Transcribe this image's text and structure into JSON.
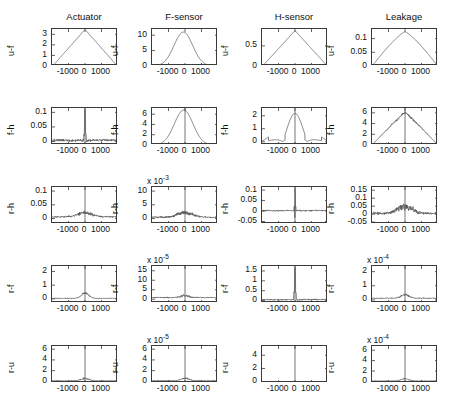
{
  "figure": {
    "grid_rows": 5,
    "grid_cols": 4,
    "line_color": "#555555",
    "axis_color": "#3a3a3a"
  },
  "column_titles": [
    {
      "label": "Actuator"
    },
    {
      "label": "F-sensor"
    },
    {
      "label": "H-sensor"
    },
    {
      "label": "Leakage"
    }
  ],
  "row_labels": [
    {
      "label": "u-f"
    },
    {
      "label": "f-h"
    },
    {
      "label": "r-h"
    },
    {
      "label": "r-f"
    },
    {
      "label": "r-u"
    }
  ],
  "xaxis": {
    "ticks": [
      "-1000",
      "0",
      "1000"
    ],
    "tick_values": [
      -1000,
      0,
      1000
    ],
    "range": [
      -2000,
      2000
    ]
  },
  "chart_data": {
    "type": "line",
    "title": "",
    "subtitle": "",
    "xlabel": "lag",
    "ylabel": "correlation",
    "grid": false,
    "legend": "none",
    "layout": {
      "rows": 5,
      "cols": 4
    },
    "shared_x": {
      "ticks": [
        -1000,
        0,
        1000
      ],
      "range": [
        -2000,
        2000
      ]
    },
    "panels": [
      {
        "row": 1,
        "col": 1,
        "row_label": "u-f",
        "col_title": "Actuator",
        "yticks": [
          "0",
          "1",
          "2",
          "3"
        ],
        "ytick_values": [
          0,
          1,
          2,
          3
        ],
        "ylim": [
          0,
          3.5
        ],
        "multiplier": "",
        "shape": "triangle",
        "peak_x": 0,
        "peak_y": 3.45,
        "baseline": 0,
        "noise": 0.0
      },
      {
        "row": 1,
        "col": 2,
        "row_label": "u-f",
        "col_title": "F-sensor",
        "yticks": [
          "0",
          "5",
          "10"
        ],
        "ytick_values": [
          0,
          5,
          10
        ],
        "ylim": [
          0,
          12
        ],
        "multiplier": "",
        "shape": "bell",
        "peak_x": -100,
        "peak_y": 11,
        "baseline": 0,
        "noise": 0.0
      },
      {
        "row": 1,
        "col": 3,
        "row_label": "u-f",
        "col_title": "H-sensor",
        "yticks": [
          "0",
          "0.5"
        ],
        "ytick_values": [
          0,
          0.5
        ],
        "ylim": [
          0,
          0.92
        ],
        "multiplier": "",
        "shape": "triangle",
        "peak_x": 0,
        "peak_y": 0.88,
        "baseline": 0,
        "noise": 0.0
      },
      {
        "row": 1,
        "col": 4,
        "row_label": "u-f",
        "col_title": "Leakage",
        "yticks": [
          "0",
          "0.05",
          "0.1"
        ],
        "ytick_values": [
          0,
          0.05,
          0.1
        ],
        "ylim": [
          0,
          0.135
        ],
        "multiplier": "",
        "shape": "triangle_round",
        "peak_x": 0,
        "peak_y": 0.125,
        "baseline": 0,
        "noise": 0.0
      },
      {
        "row": 2,
        "col": 1,
        "row_label": "f-h",
        "col_title": "",
        "yticks": [
          "0",
          "0.05",
          "0.1"
        ],
        "ytick_values": [
          0,
          0.05,
          0.1
        ],
        "ylim": [
          -0.012,
          0.115
        ],
        "multiplier": "",
        "shape": "spike",
        "peak_x": 0,
        "peak_y": 0.098,
        "baseline": 0.004,
        "noise": 0.004
      },
      {
        "row": 2,
        "col": 2,
        "row_label": "f-h",
        "col_title": "",
        "yticks": [
          "0",
          "2",
          "4",
          "6"
        ],
        "ytick_values": [
          0,
          2,
          4,
          6
        ],
        "ylim": [
          0,
          7.2
        ],
        "multiplier": "",
        "shape": "bell",
        "peak_x": -80,
        "peak_y": 6.8,
        "baseline": 0,
        "noise": 0.0
      },
      {
        "row": 2,
        "col": 3,
        "row_label": "f-h",
        "col_title": "",
        "yticks": [
          "0",
          "1",
          "2"
        ],
        "ytick_values": [
          0,
          1,
          2
        ],
        "ylim": [
          -0.25,
          2.6
        ],
        "multiplier": "",
        "shape": "oscillating",
        "peak_x": 0,
        "peak_y": 2.4,
        "baseline": 0,
        "noise": 0.0
      },
      {
        "row": 2,
        "col": 4,
        "row_label": "f-h",
        "col_title": "",
        "yticks": [
          "0",
          "2",
          "4",
          "6"
        ],
        "ytick_values": [
          0,
          2,
          4,
          6
        ],
        "ylim": [
          0,
          6.9
        ],
        "multiplier": "",
        "shape": "triangle_rough",
        "peak_x": 0,
        "peak_y": 6.1,
        "baseline": 0,
        "noise": 0.0
      },
      {
        "row": 3,
        "col": 1,
        "row_label": "r-h",
        "col_title": "",
        "yticks": [
          "0",
          "0.05",
          "0.1"
        ],
        "ytick_values": [
          0,
          0.05,
          0.1
        ],
        "ylim": [
          -0.02,
          0.115
        ],
        "multiplier": "",
        "shape": "noisy_bump",
        "peak_x": 0,
        "peak_y": 0.022,
        "baseline": 0.006,
        "noise": 0.004
      },
      {
        "row": 3,
        "col": 2,
        "row_label": "r-h",
        "col_title": "",
        "yticks": [
          "0",
          "5",
          "10"
        ],
        "ytick_values": [
          0,
          5,
          10
        ],
        "ylim": [
          -2.0,
          11.5
        ],
        "multiplier": "x 10",
        "multiplier_exp": "-3",
        "shape": "noisy_bump",
        "peak_x": 0,
        "peak_y": 2.2,
        "baseline": 0.5,
        "noise": 0.45
      },
      {
        "row": 3,
        "col": 3,
        "row_label": "r-h",
        "col_title": "",
        "yticks": [
          "-0.05",
          "0",
          "0.05",
          "0.1"
        ],
        "ytick_values": [
          -0.05,
          0,
          0.05,
          0.1
        ],
        "ylim": [
          -0.062,
          0.115
        ],
        "multiplier": "",
        "shape": "spike_bidir",
        "peak_x": 0,
        "peak_y": 0.1,
        "baseline": 0.002,
        "noise": 0.003
      },
      {
        "row": 3,
        "col": 4,
        "row_label": "r-h",
        "col_title": "",
        "yticks": [
          "-0.05",
          "0",
          "0.05",
          "0.1",
          "0.15"
        ],
        "ytick_values": [
          -0.05,
          0,
          0.05,
          0.1,
          0.15
        ],
        "ylim": [
          -0.062,
          0.17
        ],
        "multiplier": "",
        "shape": "noisy_bump",
        "peak_x": 0,
        "peak_y": 0.05,
        "baseline": 0.004,
        "noise": 0.012
      },
      {
        "row": 4,
        "col": 1,
        "row_label": "r-f",
        "col_title": "",
        "yticks": [
          "0",
          "1",
          "2"
        ],
        "ytick_values": [
          0,
          1,
          2
        ],
        "ylim": [
          -0.3,
          2.4
        ],
        "multiplier": "",
        "shape": "small_bump",
        "peak_x": 0,
        "peak_y": 0.42,
        "baseline": 0.04,
        "noise": 0.05
      },
      {
        "row": 4,
        "col": 2,
        "row_label": "r-f",
        "col_title": "",
        "yticks": [
          "0",
          "5",
          "10",
          "15"
        ],
        "ytick_values": [
          0,
          5,
          10,
          15
        ],
        "ylim": [
          -2.0,
          17.5
        ],
        "multiplier": "x 10",
        "multiplier_exp": "-5",
        "shape": "small_bump",
        "peak_x": 0,
        "peak_y": 1.9,
        "baseline": 0.9,
        "noise": 0.5
      },
      {
        "row": 4,
        "col": 3,
        "row_label": "r-f",
        "col_title": "",
        "yticks": [
          "0",
          "0.5",
          "1",
          "1.5"
        ],
        "ytick_values": [
          0,
          0.5,
          1,
          1.5
        ],
        "ylim": [
          -0.12,
          1.75
        ],
        "multiplier": "",
        "shape": "spike",
        "peak_x": 0,
        "peak_y": 1.6,
        "baseline": 0.05,
        "noise": 0.03
      },
      {
        "row": 4,
        "col": 4,
        "row_label": "r-f",
        "col_title": "",
        "yticks": [
          "0",
          "1",
          "2"
        ],
        "ytick_values": [
          0,
          1,
          2
        ],
        "ylim": [
          -0.22,
          2.4
        ],
        "multiplier": "x 10",
        "multiplier_exp": "-4",
        "shape": "small_bump",
        "peak_x": 0,
        "peak_y": 0.38,
        "baseline": 0.12,
        "noise": 0.06
      },
      {
        "row": 5,
        "col": 1,
        "row_label": "r-u",
        "col_title": "",
        "yticks": [
          "0",
          "2",
          "4",
          "6"
        ],
        "ytick_values": [
          0,
          2,
          4,
          6
        ],
        "ylim": [
          -0.3,
          6.6
        ],
        "multiplier": "",
        "shape": "small_bump",
        "peak_x": 0,
        "peak_y": 0.55,
        "baseline": 0.12,
        "noise": 0.1
      },
      {
        "row": 5,
        "col": 2,
        "row_label": "r-u",
        "col_title": "",
        "yticks": [
          "0",
          "2",
          "4",
          "6"
        ],
        "ytick_values": [
          0,
          2,
          4,
          6
        ],
        "ylim": [
          -0.3,
          6.6
        ],
        "multiplier": "x 10",
        "multiplier_exp": "-5",
        "shape": "small_bump",
        "peak_x": 0,
        "peak_y": 0.6,
        "baseline": 0.14,
        "noise": 0.1
      },
      {
        "row": 5,
        "col": 3,
        "row_label": "r-u",
        "col_title": "",
        "yticks": [
          "0",
          "2",
          "4"
        ],
        "ytick_values": [
          0,
          2,
          4
        ],
        "ylim": [
          -0.2,
          5.4
        ],
        "multiplier": "",
        "shape": "flat",
        "peak_x": 0,
        "peak_y": 0.05,
        "baseline": 0.02,
        "noise": 0.01
      },
      {
        "row": 5,
        "col": 4,
        "row_label": "r-u",
        "col_title": "",
        "yticks": [
          "0",
          "2",
          "4",
          "6"
        ],
        "ytick_values": [
          0,
          2,
          4,
          6
        ],
        "ylim": [
          -0.3,
          6.8
        ],
        "multiplier": "x 10",
        "multiplier_exp": "-4",
        "shape": "small_bump",
        "peak_x": 0,
        "peak_y": 0.5,
        "baseline": 0.1,
        "noise": 0.08
      }
    ]
  }
}
